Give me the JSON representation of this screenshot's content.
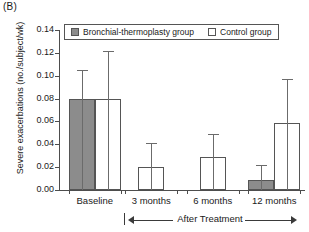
{
  "panel": {
    "label": "(B)"
  },
  "legend": {
    "items": [
      {
        "label": "Bronchial-thermoplasty group",
        "style": "filled",
        "color": "#8c8c8c"
      },
      {
        "label": "Control group",
        "style": "open",
        "color": "#ffffff"
      }
    ]
  },
  "annotation": {
    "after_treatment": "After Treatment"
  },
  "chart_data": {
    "type": "bar",
    "title": "(B)",
    "xlabel": "",
    "ylabel": "Severe exacerbations (no./subject/wk)",
    "ylim": [
      0,
      0.14
    ],
    "yticks": [
      "0.00",
      "0.02",
      "0.04",
      "0.06",
      "0.08",
      "0.10",
      "0.12",
      "0.14"
    ],
    "ytick_values": [
      0,
      0.02,
      0.04,
      0.06,
      0.08,
      0.1,
      0.12,
      0.14
    ],
    "grid": false,
    "legend_position": "top-left-inside",
    "categories": [
      "Baseline",
      "3 months",
      "6 months",
      "12 months"
    ],
    "series": [
      {
        "name": "Bronchial-thermoplasty group",
        "fill": "#8c8c8c",
        "values": [
          0.08,
          null,
          null,
          0.009
        ],
        "errors_upper": [
          0.105,
          null,
          null,
          0.022
        ]
      },
      {
        "name": "Control group",
        "fill": "#ffffff",
        "values": [
          0.08,
          0.02,
          0.029,
          0.059
        ],
        "errors_upper": [
          0.122,
          0.041,
          0.049,
          0.097
        ]
      }
    ],
    "annotations": [
      {
        "text": "After Treatment",
        "spans": [
          "3 months",
          "12 months"
        ]
      }
    ]
  }
}
